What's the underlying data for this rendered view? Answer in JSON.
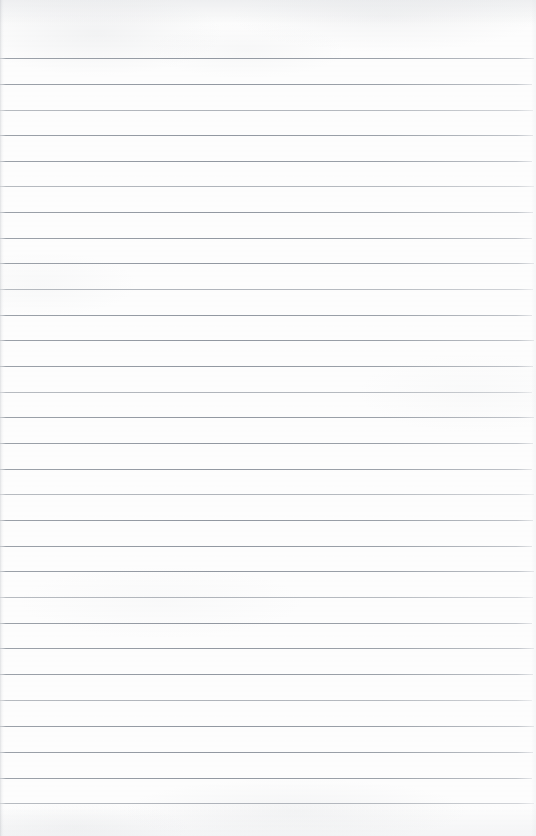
{
  "document": {
    "kind": "scanned-lined-notebook-page",
    "title": "",
    "page_width": 536,
    "page_height": 836,
    "visible_text": "",
    "written_content": "",
    "placeholder": ""
  },
  "paper": {
    "background_color": "#fdfdfd",
    "grain_color": "#bcc0c6",
    "edge_shadow_color": "#a8acb2",
    "top_margin_px": 58,
    "bottom_margin_px": 30
  },
  "rules": {
    "line_color": "#969ca4",
    "line_thickness_px": 1,
    "spacing_px": 25.7,
    "first_line_y": 58,
    "last_line_y": 803,
    "count": 30,
    "left_inset_px": 0,
    "right_inset_px": 3,
    "lines": [
      {
        "y": 58,
        "right_inset": 2,
        "weight": "strong"
      },
      {
        "y": 84,
        "right_inset": 4,
        "weight": "strong"
      },
      {
        "y": 110,
        "right_inset": 3,
        "weight": "faint"
      },
      {
        "y": 135,
        "right_inset": 3,
        "weight": "strong"
      },
      {
        "y": 161,
        "right_inset": 4,
        "weight": "strong"
      },
      {
        "y": 186,
        "right_inset": 2,
        "weight": "faint"
      },
      {
        "y": 212,
        "right_inset": 3,
        "weight": "strong"
      },
      {
        "y": 238,
        "right_inset": 4,
        "weight": "strong"
      },
      {
        "y": 263,
        "right_inset": 2,
        "weight": "strong"
      },
      {
        "y": 289,
        "right_inset": 3,
        "weight": "faint"
      },
      {
        "y": 315,
        "right_inset": 4,
        "weight": "strong"
      },
      {
        "y": 340,
        "right_inset": 2,
        "weight": "strong"
      },
      {
        "y": 366,
        "right_inset": 3,
        "weight": "strong"
      },
      {
        "y": 392,
        "right_inset": 4,
        "weight": "faint"
      },
      {
        "y": 417,
        "right_inset": 2,
        "weight": "strong"
      },
      {
        "y": 443,
        "right_inset": 3,
        "weight": "strong"
      },
      {
        "y": 469,
        "right_inset": 4,
        "weight": "strong"
      },
      {
        "y": 494,
        "right_inset": 2,
        "weight": "faint"
      },
      {
        "y": 520,
        "right_inset": 3,
        "weight": "strong"
      },
      {
        "y": 546,
        "right_inset": 4,
        "weight": "strong"
      },
      {
        "y": 571,
        "right_inset": 2,
        "weight": "strong"
      },
      {
        "y": 597,
        "right_inset": 3,
        "weight": "faint"
      },
      {
        "y": 623,
        "right_inset": 4,
        "weight": "strong"
      },
      {
        "y": 648,
        "right_inset": 2,
        "weight": "strong"
      },
      {
        "y": 674,
        "right_inset": 3,
        "weight": "strong"
      },
      {
        "y": 700,
        "right_inset": 4,
        "weight": "faint"
      },
      {
        "y": 726,
        "right_inset": 2,
        "weight": "strong"
      },
      {
        "y": 752,
        "right_inset": 3,
        "weight": "strong"
      },
      {
        "y": 778,
        "right_inset": 4,
        "weight": "strong"
      },
      {
        "y": 803,
        "right_inset": 2,
        "weight": "faint"
      }
    ]
  }
}
